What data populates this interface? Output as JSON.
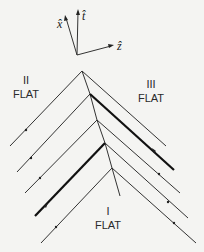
{
  "axes": {
    "x_label": "x̂",
    "t_label": "t̂",
    "z_label": "ẑ"
  },
  "regions": {
    "region_2": {
      "numeral": "II",
      "label": "FLAT"
    },
    "region_3": {
      "numeral": "III",
      "label": "FLAT"
    },
    "region_1": {
      "numeral": "I",
      "label": "FLAT"
    }
  },
  "colors": {
    "background": "#f4f4f2",
    "ink": "#222222"
  }
}
